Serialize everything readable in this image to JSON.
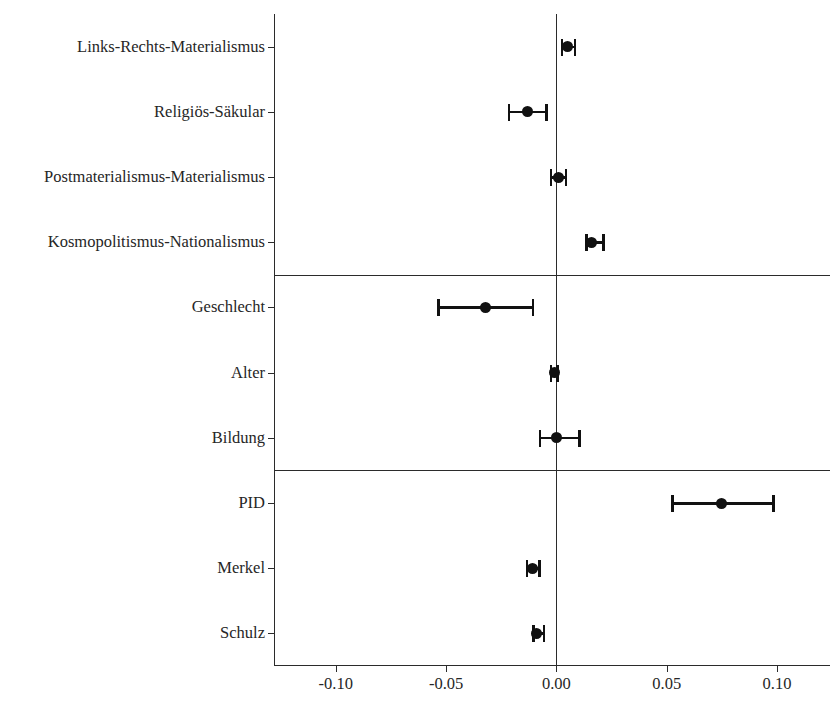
{
  "chart_data": {
    "type": "scatter",
    "subtype": "coefficient-forest-plot",
    "title": "",
    "subtitle": "",
    "xlabel": "",
    "ylabel": "",
    "xlim": [
      -0.128,
      0.124
    ],
    "xticks": [
      -0.1,
      -0.05,
      0.0,
      0.05,
      0.1
    ],
    "xticklabels": [
      "-0.10",
      "-0.05",
      "0.00",
      "0.05",
      "0.10"
    ],
    "grid": false,
    "legend": null,
    "zero_reference_line": 0.0,
    "group_separators_after": [
      "Kosmopolitismus-Nationalismus",
      "Bildung"
    ],
    "categories": [
      "Links-Rechts-Materialismus",
      "Religiös-Säkular",
      "Postmaterialismus-Materialismus",
      "Kosmopolitismus-Nationalismus",
      "Geschlecht",
      "Alter",
      "Bildung",
      "PID",
      "Merkel",
      "Schulz"
    ],
    "points": [
      {
        "label": "Links-Rechts-Materialismus",
        "estimate": 0.005,
        "ci_low": 0.002,
        "ci_high": 0.009
      },
      {
        "label": "Religiös-Säkular",
        "estimate": -0.013,
        "ci_low": -0.022,
        "ci_high": -0.004
      },
      {
        "label": "Postmaterialismus-Materialismus",
        "estimate": 0.001,
        "ci_low": -0.003,
        "ci_high": 0.005
      },
      {
        "label": "Kosmopolitismus-Nationalismus",
        "estimate": 0.016,
        "ci_low": 0.013,
        "ci_high": 0.022
      },
      {
        "label": "Geschlecht",
        "estimate": -0.032,
        "ci_low": -0.054,
        "ci_high": -0.01
      },
      {
        "label": "Alter",
        "estimate": -0.001,
        "ci_low": -0.003,
        "ci_high": 0.001
      },
      {
        "label": "Bildung",
        "estimate": 0.0,
        "ci_low": -0.008,
        "ci_high": 0.011
      },
      {
        "label": "PID",
        "estimate": 0.075,
        "ci_low": 0.052,
        "ci_high": 0.099
      },
      {
        "label": "Merkel",
        "estimate": -0.011,
        "ci_low": -0.014,
        "ci_high": -0.007
      },
      {
        "label": "Schulz",
        "estimate": -0.009,
        "ci_low": -0.011,
        "ci_high": -0.005
      }
    ],
    "colors": {
      "point": "#111111",
      "ci": "#111111",
      "axis": "#2b2b2b",
      "text": "#262626",
      "background": "#ffffff"
    }
  }
}
